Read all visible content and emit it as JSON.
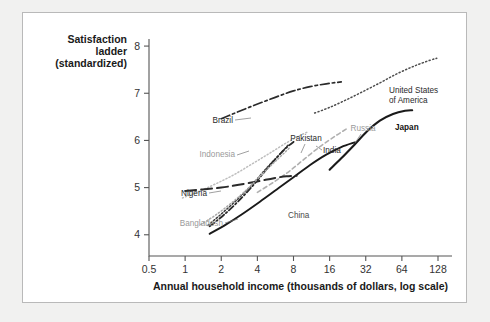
{
  "chart_data": {
    "type": "line",
    "title": "",
    "xlabel": "Annual household income (thousands of dollars, log scale)",
    "ylabel": "Satisfaction ladder (standardized)",
    "ylabel_lines": [
      "Satisfaction",
      "ladder",
      "(standardized)"
    ],
    "x_scale": "log2",
    "xlim": [
      0.5,
      128
    ],
    "ylim": [
      3.55,
      8.15
    ],
    "xticks": [
      0.5,
      1,
      2,
      4,
      8,
      16,
      32,
      64,
      128
    ],
    "xtick_labels": [
      "0.5",
      "1",
      "2",
      "4",
      "8",
      "16",
      "32",
      "64",
      "128"
    ],
    "yticks": [
      4,
      5,
      6,
      7,
      8
    ],
    "ytick_labels": [
      "4",
      "5",
      "6",
      "7",
      "8"
    ],
    "grid": false,
    "legend": "inline-labels",
    "series": [
      {
        "name": "Brazil",
        "label": "Brazil",
        "style": "dashdot",
        "color": "#2b2b2b",
        "width": 1.7,
        "dash": "9,3,2.5,3",
        "label_x": 210,
        "label_y": 110,
        "label_anchor": "end",
        "label_class": "dark",
        "leader": [
          [
            212,
            107
          ],
          [
            228,
            105
          ]
        ],
        "x": [
          2.0,
          2.6,
          3.4,
          4.5,
          6.0,
          8.0,
          11.0,
          15.0,
          20.0
        ],
        "y": [
          6.46,
          6.58,
          6.7,
          6.82,
          6.94,
          7.05,
          7.14,
          7.2,
          7.24
        ]
      },
      {
        "name": "United States of America",
        "label": "United States of America",
        "label_lines": [
          "United States",
          "of America"
        ],
        "style": "dotted",
        "color": "#4d4d4d",
        "width": 1.5,
        "dash": "1.2,2.4",
        "label_x": 366,
        "label_y": 80,
        "label_anchor": "start",
        "label_class": "dark",
        "x": [
          12.0,
          16.0,
          22.0,
          30.0,
          42.0,
          58.0,
          80.0,
          110.0,
          125.0
        ],
        "y": [
          6.58,
          6.7,
          6.86,
          7.03,
          7.22,
          7.41,
          7.57,
          7.7,
          7.74
        ]
      },
      {
        "name": "Indonesia",
        "label": "Indonesia",
        "style": "dotted",
        "color": "#bdbdbd",
        "width": 1.5,
        "dash": "1.2,2.2",
        "label_x": 212,
        "label_y": 144,
        "label_anchor": "end",
        "label_class": "light",
        "leader": [
          [
            214,
            142
          ],
          [
            226,
            138
          ]
        ],
        "x": [
          0.95,
          1.3,
          1.8,
          2.5,
          3.5,
          5.0,
          7.0,
          9.0,
          10.5
        ],
        "y": [
          4.78,
          4.92,
          5.08,
          5.26,
          5.48,
          5.72,
          5.95,
          6.1,
          6.18
        ]
      },
      {
        "name": "Pakistan",
        "label": "Pakistan",
        "style": "dotted-dense",
        "color": "#3d3d3d",
        "width": 1.5,
        "dash": "1.6,2.0",
        "label_x": 283,
        "label_y": 128,
        "label_anchor": "middle",
        "label_class": "dark",
        "leader": [
          [
            282,
            131
          ],
          [
            278,
            140
          ]
        ],
        "x": [
          1.55,
          2.0,
          2.7,
          3.6,
          4.8,
          6.0,
          7.2
        ],
        "y": [
          4.2,
          4.44,
          4.74,
          5.06,
          5.42,
          5.68,
          5.9
        ]
      },
      {
        "name": "India",
        "label": "India",
        "style": "dashdot-short",
        "color": "#2a2a2a",
        "width": 1.8,
        "dash": "6,2.5,1.6,2.5",
        "label_x": 300,
        "label_y": 140,
        "label_anchor": "start",
        "label_class": "dark",
        "leader": [
          [
            299,
            137
          ],
          [
            293,
            133
          ]
        ],
        "x": [
          1.6,
          2.1,
          2.9,
          3.9,
          5.2,
          6.8,
          8.3
        ],
        "y": [
          4.18,
          4.42,
          4.76,
          5.12,
          5.5,
          5.82,
          6.0
        ]
      },
      {
        "name": "Russia",
        "label": "Russia",
        "style": "dashed-light",
        "color": "#b0b0b0",
        "width": 1.6,
        "dash": "4,3",
        "label_x": 340,
        "label_y": 118,
        "label_anchor": "middle",
        "label_class": "light",
        "leader": [
          [
            338,
            121
          ],
          [
            332,
            130
          ]
        ],
        "x": [
          4.0,
          5.5,
          7.5,
          10.0,
          13.5,
          18.0,
          22.0
        ],
        "y": [
          4.9,
          5.12,
          5.36,
          5.62,
          5.88,
          6.1,
          6.24
        ]
      },
      {
        "name": "Japan",
        "label": "Japan",
        "style": "solid",
        "color": "#1a1a1a",
        "width": 2.1,
        "dash": "",
        "label_x": 372,
        "label_y": 117,
        "label_anchor": "start",
        "label_class": "bold",
        "x": [
          16.0,
          20.0,
          26.0,
          33.0,
          42.0,
          54.0,
          68.0,
          78.0
        ],
        "y": [
          5.38,
          5.62,
          5.92,
          6.2,
          6.42,
          6.56,
          6.63,
          6.64
        ]
      },
      {
        "name": "China",
        "label": "China",
        "style": "solid",
        "color": "#1a1a1a",
        "width": 1.9,
        "dash": "",
        "label_x": 265,
        "label_y": 205,
        "label_anchor": "start",
        "x": [
          1.6,
          2.2,
          3.0,
          4.2,
          5.8,
          8.0,
          11.0,
          15.0,
          20.0,
          26.0
        ],
        "y": [
          4.02,
          4.22,
          4.44,
          4.7,
          4.96,
          5.22,
          5.48,
          5.7,
          5.86,
          5.96
        ]
      },
      {
        "name": "Nigeria",
        "label": "Nigeria",
        "style": "longdash",
        "color": "#2a2a2a",
        "width": 2.0,
        "dash": "11,5",
        "label_x": 184,
        "label_y": 183,
        "label_anchor": "end",
        "label_class": "dark",
        "leader": [
          [
            186,
            180
          ],
          [
            198,
            178
          ]
        ],
        "x": [
          1.0,
          1.4,
          2.0,
          2.8,
          4.0,
          5.5,
          7.0,
          8.5
        ],
        "y": [
          4.93,
          4.96,
          5.0,
          5.06,
          5.13,
          5.2,
          5.24,
          5.25
        ]
      },
      {
        "name": "Bangladesh",
        "label": "Bangladesh",
        "style": "dotted",
        "color": "#a8a8a8",
        "width": 1.5,
        "dash": "1.3,2.2",
        "label_x": 200,
        "label_y": 213,
        "label_anchor": "end",
        "label_class": "light",
        "leader": [
          [
            202,
            210
          ],
          [
            215,
            206
          ]
        ],
        "x": [
          1.35,
          1.8,
          2.5,
          3.4,
          4.6,
          6.0,
          7.4
        ],
        "y": [
          4.22,
          4.42,
          4.7,
          5.0,
          5.34,
          5.62,
          5.84
        ]
      }
    ]
  }
}
